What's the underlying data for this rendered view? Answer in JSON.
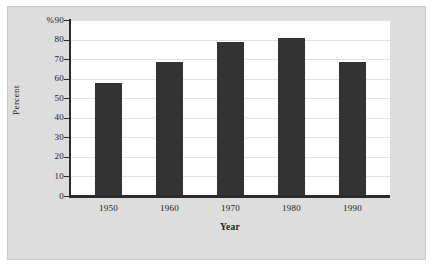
{
  "chart_data": {
    "type": "bar",
    "title": "",
    "categories": [
      "1950",
      "1960",
      "1970",
      "1980",
      "1990"
    ],
    "values": [
      58,
      68.5,
      79,
      81,
      68.5
    ],
    "xlabel": "Year",
    "ylabel": "Percent",
    "ylim": [
      0,
      90
    ],
    "y_ticks": [
      "0",
      "10",
      "20",
      "30",
      "40",
      "50",
      "60",
      "70",
      "80",
      "%90"
    ],
    "y_tick_values": [
      0,
      10,
      20,
      30,
      40,
      50,
      60,
      70,
      80,
      90
    ],
    "y_unit_symbol": "%",
    "grid": true,
    "legend": "none",
    "bar_color": "#333333",
    "plot_background": "#ffffff",
    "figure_background": "#dddddd",
    "axis_color": "#2b2b2b",
    "gridline_color": "#e2e2e2"
  }
}
